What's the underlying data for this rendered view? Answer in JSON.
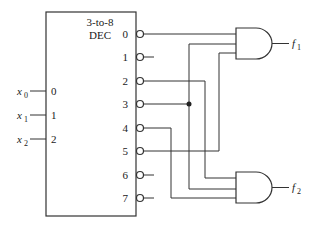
{
  "decoder": {
    "title_line1": "3-to-8",
    "title_line2": "DEC",
    "inputs": [
      {
        "pin": "0",
        "signal": "x",
        "sub": "0"
      },
      {
        "pin": "1",
        "signal": "x",
        "sub": "1"
      },
      {
        "pin": "2",
        "signal": "x",
        "sub": "2"
      }
    ],
    "outputs": [
      "0",
      "1",
      "2",
      "3",
      "4",
      "5",
      "6",
      "7"
    ],
    "output_polarity": "active-low (inversion bubbles)"
  },
  "gates": [
    {
      "type": "AND",
      "inputs_from_outputs": [
        "0",
        "3",
        "5"
      ],
      "output": {
        "signal": "f",
        "sub": "1"
      }
    },
    {
      "type": "AND",
      "inputs_from_outputs": [
        "2",
        "3",
        "4"
      ],
      "output": {
        "signal": "f",
        "sub": "2"
      }
    }
  ],
  "junction": {
    "at_output": "3"
  },
  "colors": {
    "line": "#333333",
    "background": "#ffffff"
  }
}
